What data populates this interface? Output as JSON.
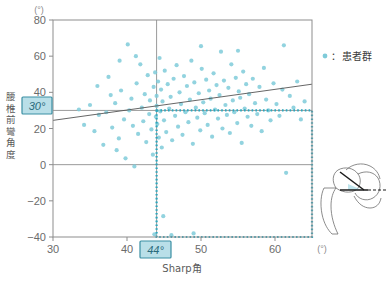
{
  "chart_data": {
    "type": "scatter",
    "title": "",
    "xlabel": "Sharp角",
    "ylabel": "腰椎前彎角度",
    "x_unit": "(°)",
    "y_unit": "(°)",
    "xlim": [
      30,
      65
    ],
    "ylim": [
      -40,
      80
    ],
    "xticks": [
      30,
      40,
      50,
      60
    ],
    "yticks": [
      80,
      60,
      40,
      20,
      0,
      -20,
      -40
    ],
    "grid": false,
    "legend_position": "right",
    "series": [
      {
        "name": "患者群",
        "marker": "circle",
        "color": "#7fcbd9",
        "points": [
          [
            33.5,
            30.5
          ],
          [
            34.2,
            22.0
          ],
          [
            35.0,
            33.0
          ],
          [
            35.6,
            18.5
          ],
          [
            36.2,
            27.5
          ],
          [
            36.8,
            11.0
          ],
          [
            37.2,
            29.0
          ],
          [
            37.5,
            48.5
          ],
          [
            38.0,
            20.5
          ],
          [
            38.4,
            34.0
          ],
          [
            38.6,
            8.0
          ],
          [
            38.9,
            14.5
          ],
          [
            39.2,
            41.0
          ],
          [
            39.6,
            25.0
          ],
          [
            39.8,
            3.5
          ],
          [
            40.1,
            66.5
          ],
          [
            40.3,
            30.0
          ],
          [
            40.6,
            36.5
          ],
          [
            40.8,
            21.5
          ],
          [
            41.0,
            -1.0
          ],
          [
            41.3,
            45.0
          ],
          [
            41.5,
            17.0
          ],
          [
            41.8,
            55.5
          ],
          [
            42.0,
            31.5
          ],
          [
            42.2,
            24.0
          ],
          [
            42.4,
            39.0
          ],
          [
            42.6,
            12.5
          ],
          [
            42.8,
            49.5
          ],
          [
            43.0,
            28.0
          ],
          [
            43.1,
            35.5
          ],
          [
            43.3,
            19.5
          ],
          [
            43.5,
            5.5
          ],
          [
            43.6,
            43.0
          ],
          [
            43.8,
            51.0
          ],
          [
            43.9,
            26.5
          ],
          [
            44.0,
            38.0
          ],
          [
            44.0,
            32.5
          ],
          [
            44.1,
            22.5
          ],
          [
            44.2,
            46.0
          ],
          [
            44.3,
            15.0
          ],
          [
            44.4,
            59.0
          ],
          [
            44.5,
            29.5
          ],
          [
            44.6,
            41.5
          ],
          [
            44.7,
            9.5
          ],
          [
            44.8,
            35.0
          ],
          [
            44.9,
            -28.5
          ],
          [
            45.0,
            24.5
          ],
          [
            45.1,
            52.0
          ],
          [
            45.3,
            18.0
          ],
          [
            45.5,
            44.5
          ],
          [
            45.7,
            31.0
          ],
          [
            45.9,
            37.5
          ],
          [
            46.1,
            13.5
          ],
          [
            46.3,
            47.5
          ],
          [
            46.5,
            27.0
          ],
          [
            46.7,
            55.0
          ],
          [
            46.9,
            21.0
          ],
          [
            47.1,
            40.0
          ],
          [
            47.3,
            33.5
          ],
          [
            47.5,
            16.5
          ],
          [
            47.7,
            49.0
          ],
          [
            47.9,
            29.0
          ],
          [
            48.1,
            43.5
          ],
          [
            48.3,
            23.5
          ],
          [
            48.5,
            36.0
          ],
          [
            48.7,
            57.5
          ],
          [
            48.9,
            11.5
          ],
          [
            49.1,
            45.5
          ],
          [
            49.3,
            31.5
          ],
          [
            49.5,
            26.0
          ],
          [
            49.7,
            39.5
          ],
          [
            49.9,
            19.0
          ],
          [
            50.1,
            53.0
          ],
          [
            50.3,
            34.5
          ],
          [
            50.5,
            28.5
          ],
          [
            50.7,
            47.0
          ],
          [
            50.9,
            22.0
          ],
          [
            51.1,
            41.0
          ],
          [
            51.3,
            36.5
          ],
          [
            51.5,
            15.5
          ],
          [
            51.7,
            50.5
          ],
          [
            51.9,
            30.5
          ],
          [
            52.1,
            44.0
          ],
          [
            52.3,
            25.5
          ],
          [
            52.5,
            38.5
          ],
          [
            52.7,
            62.5
          ],
          [
            52.9,
            20.0
          ],
          [
            53.1,
            46.5
          ],
          [
            53.3,
            33.0
          ],
          [
            53.5,
            27.5
          ],
          [
            53.7,
            42.5
          ],
          [
            53.9,
            17.5
          ],
          [
            54.1,
            55.5
          ],
          [
            54.3,
            35.5
          ],
          [
            54.5,
            29.0
          ],
          [
            54.7,
            48.0
          ],
          [
            54.9,
            23.0
          ],
          [
            55.1,
            40.5
          ],
          [
            55.3,
            37.0
          ],
          [
            55.5,
            12.0
          ],
          [
            55.7,
            51.5
          ],
          [
            55.9,
            31.0
          ],
          [
            56.1,
            44.5
          ],
          [
            56.3,
            26.5
          ],
          [
            56.5,
            39.0
          ],
          [
            56.8,
            21.5
          ],
          [
            57.0,
            47.5
          ],
          [
            57.3,
            34.0
          ],
          [
            57.6,
            28.0
          ],
          [
            57.9,
            43.0
          ],
          [
            58.2,
            18.5
          ],
          [
            58.5,
            53.5
          ],
          [
            58.8,
            36.0
          ],
          [
            59.1,
            30.0
          ],
          [
            59.4,
            24.5
          ],
          [
            59.8,
            45.0
          ],
          [
            60.2,
            33.5
          ],
          [
            60.6,
            27.0
          ],
          [
            61.0,
            41.5
          ],
          [
            61.5,
            -4.5
          ],
          [
            62.0,
            38.0
          ],
          [
            62.5,
            31.5
          ],
          [
            63.0,
            46.0
          ],
          [
            63.5,
            25.0
          ],
          [
            64.0,
            35.0
          ],
          [
            43.7,
            -38.5
          ],
          [
            46.0,
            -39.0
          ],
          [
            49.0,
            -38.0
          ],
          [
            39.0,
            57.5
          ],
          [
            41.2,
            60.0
          ],
          [
            50.0,
            65.5
          ],
          [
            55.0,
            63.0
          ],
          [
            61.2,
            66.0
          ],
          [
            36.0,
            43.5
          ],
          [
            37.8,
            38.5
          ]
        ]
      }
    ],
    "trendline": {
      "name": "regression-line",
      "color": "#555555",
      "x_start": 30,
      "y_start": 24.5,
      "x_end": 65,
      "y_end": 44.5
    },
    "reference_lines": [
      {
        "name": "lumbar-lordosis-30",
        "axis": "y",
        "value": 30,
        "label": "30°",
        "style": "solid",
        "color": "#9a9a9a"
      },
      {
        "name": "sharp-angle-44",
        "axis": "x",
        "value": 44,
        "label": "44°",
        "style": "solid",
        "color": "#9a9a9a"
      },
      {
        "name": "y-zero-line",
        "axis": "y",
        "value": 0,
        "label": "",
        "style": "solid",
        "color": "#9a9a9a"
      }
    ],
    "highlight_region": {
      "name": "risk-quadrant",
      "x_from": 44,
      "x_to": 65,
      "y_from": -40,
      "y_to": 30,
      "border_style": "dotted",
      "border_color": "#29a8bf"
    },
    "annotations": {
      "x_threshold_label": "44°",
      "y_threshold_label": "30°",
      "threshold_box_fill": "#b9dfe8",
      "threshold_box_border": "#3b8fa3"
    }
  },
  "legend": {
    "separator": "：",
    "entries": [
      {
        "label": "患者群",
        "marker_color": "#7fcbd9",
        "marker": "dot"
      }
    ]
  },
  "axis": {
    "y_title": "腰椎前彎角度",
    "x_title": "Sharp角",
    "top_unit": "(°)",
    "right_unit": "(°)"
  },
  "illustration": {
    "name": "hip-sharp-angle-diagram",
    "description": "hip-joint-radiograph-sketch",
    "line_color": "#1a1a1a",
    "outline_color": "#6e6e6e",
    "shade_color": "#a9dbe6"
  },
  "colors": {
    "point": "#7fcbd9",
    "trend": "#555555",
    "frame": "#8d8d8d",
    "dotted": "#29a8bf",
    "highlight_fill": "#b9dfe8",
    "highlight_border": "#3b8fa3",
    "text": "#5a5a5a"
  }
}
